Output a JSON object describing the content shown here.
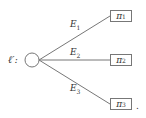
{
  "root": {
    "label": "ℓ′:"
  },
  "edges": [
    {
      "label": "E",
      "sub": "1"
    },
    {
      "label": "E",
      "sub": "2"
    },
    {
      "label": "E",
      "sub": "3"
    }
  ],
  "leaves": [
    {
      "label": "π",
      "sub": "1"
    },
    {
      "label": "π",
      "sub": "2"
    },
    {
      "label": "π",
      "sub": "3"
    }
  ],
  "trailing": "."
}
